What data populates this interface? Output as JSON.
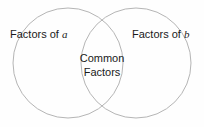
{
  "diagram": {
    "type": "venn-2-set",
    "canvas": {
      "width": 204,
      "height": 127,
      "background": "#fefefe"
    },
    "stroke_color": "#b5b5b5",
    "text_color": "#1a1a1a",
    "circles": [
      {
        "name": "left",
        "cx": 68,
        "cy": 63,
        "r": 55
      },
      {
        "name": "right",
        "cx": 136,
        "cy": 63,
        "r": 55
      }
    ],
    "labels": {
      "left_prefix": "Factors of ",
      "left_variable": "a",
      "right_prefix": "Factors of ",
      "right_variable": "b",
      "center_line1": "Common",
      "center_line2": "Factors"
    }
  }
}
